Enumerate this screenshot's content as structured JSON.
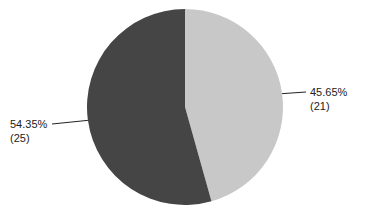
{
  "chart_data": {
    "type": "pie",
    "title": "",
    "slices": [
      {
        "label": "45.65%",
        "count_label": "(21)",
        "value": 21,
        "percent": 45.65,
        "color": "#c8c8c8"
      },
      {
        "label": "54.35%",
        "count_label": "(25)",
        "value": 25,
        "percent": 54.35,
        "color": "#454545"
      }
    ],
    "start_angle": "12 o'clock",
    "direction": "clockwise",
    "legend": "none"
  }
}
